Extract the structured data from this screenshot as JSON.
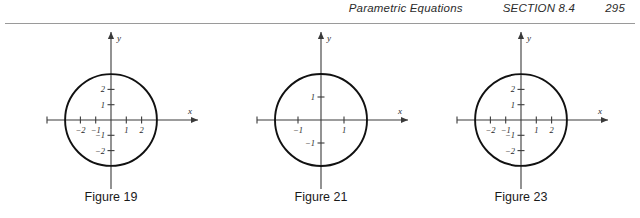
{
  "header": {
    "chapter_title": "Parametric Equations",
    "section_label": "SECTION 8.4",
    "page_number": "295",
    "rule_color": "#9a9a9a"
  },
  "colors": {
    "curve": "#111111",
    "axis": "#3a3a3a",
    "text": "#2a2a2a",
    "caption": "#1a1a1a",
    "background": "#ffffff"
  },
  "figures": [
    {
      "caption": "Figure 19",
      "origin": {
        "x": 105,
        "y": 94
      },
      "unit_px": 15.3,
      "radius_units": 3,
      "x_axis": {
        "start_px": 41,
        "end_px": 192,
        "arrow": true,
        "end_cap": true,
        "label": "x"
      },
      "y_axis": {
        "start_px": 163,
        "end_px": 6,
        "arrow": true,
        "label": "y"
      },
      "x_ticks": [
        {
          "value": -2,
          "label": "−2"
        },
        {
          "value": -1,
          "label": "−1"
        },
        {
          "value": 1,
          "label": "1"
        },
        {
          "value": 2,
          "label": "2"
        }
      ],
      "y_ticks": [
        {
          "value": 2,
          "label": "2"
        },
        {
          "value": 1,
          "label": "1"
        },
        {
          "value": -1,
          "label": "−1"
        },
        {
          "value": -2,
          "label": "−2"
        }
      ]
    },
    {
      "caption": "Figure 21",
      "origin": {
        "x": 105,
        "y": 94
      },
      "unit_px": 23.0,
      "radius_units": 2,
      "x_axis": {
        "start_px": 41,
        "end_px": 192,
        "arrow": true,
        "end_cap": true,
        "label": "x"
      },
      "y_axis": {
        "start_px": 163,
        "end_px": 6,
        "arrow": true,
        "label": "y"
      },
      "x_ticks": [
        {
          "value": -1,
          "label": "−1"
        },
        {
          "value": 1,
          "label": "1"
        }
      ],
      "y_ticks": [
        {
          "value": 1,
          "label": "1"
        },
        {
          "value": -1,
          "label": "−1"
        }
      ]
    },
    {
      "caption": "Figure 23",
      "origin": {
        "x": 105,
        "y": 94
      },
      "unit_px": 15.3,
      "radius_units": 3,
      "x_axis": {
        "start_px": 41,
        "end_px": 192,
        "arrow": true,
        "end_cap": true,
        "label": "x"
      },
      "y_axis": {
        "start_px": 163,
        "end_px": 6,
        "arrow": true,
        "label": "y"
      },
      "x_ticks": [
        {
          "value": -2,
          "label": "−2"
        },
        {
          "value": -1,
          "label": "−1"
        },
        {
          "value": 1,
          "label": "1"
        },
        {
          "value": 2,
          "label": "2"
        }
      ],
      "y_ticks": [
        {
          "value": 2,
          "label": "2"
        },
        {
          "value": 1,
          "label": "1"
        },
        {
          "value": -1,
          "label": "−1"
        },
        {
          "value": -2,
          "label": "−2"
        }
      ]
    }
  ],
  "chart_data": [
    {
      "type": "line",
      "title": "Figure 19",
      "shape": "circle",
      "center": [
        0,
        0
      ],
      "radius": 3,
      "equation": "x^2 + y^2 = 9",
      "xlabel": "x",
      "ylabel": "y",
      "xlim": [
        -4.2,
        5.7
      ],
      "ylim": [
        -4.3,
        4.9
      ],
      "xticks": [
        -2,
        -1,
        1,
        2
      ],
      "yticks": [
        -2,
        -1,
        1,
        2
      ],
      "grid": false,
      "legend": null
    },
    {
      "type": "line",
      "title": "Figure 21",
      "shape": "circle",
      "center": [
        0,
        0
      ],
      "radius": 2,
      "equation": "x^2 + y^2 = 4",
      "xlabel": "x",
      "ylabel": "y",
      "xlim": [
        -2.8,
        3.8
      ],
      "ylim": [
        -2.9,
        3.2
      ],
      "xticks": [
        -1,
        1
      ],
      "yticks": [
        -1,
        1
      ],
      "grid": false,
      "legend": null
    },
    {
      "type": "line",
      "title": "Figure 23",
      "shape": "circle",
      "center": [
        0,
        0
      ],
      "radius": 3,
      "equation": "x^2 + y^2 = 9",
      "xlabel": "x",
      "ylabel": "y",
      "xlim": [
        -4.2,
        5.7
      ],
      "ylim": [
        -4.3,
        4.9
      ],
      "xticks": [
        -2,
        -1,
        1,
        2
      ],
      "yticks": [
        -2,
        -1,
        1,
        2
      ],
      "grid": false,
      "legend": null
    }
  ]
}
